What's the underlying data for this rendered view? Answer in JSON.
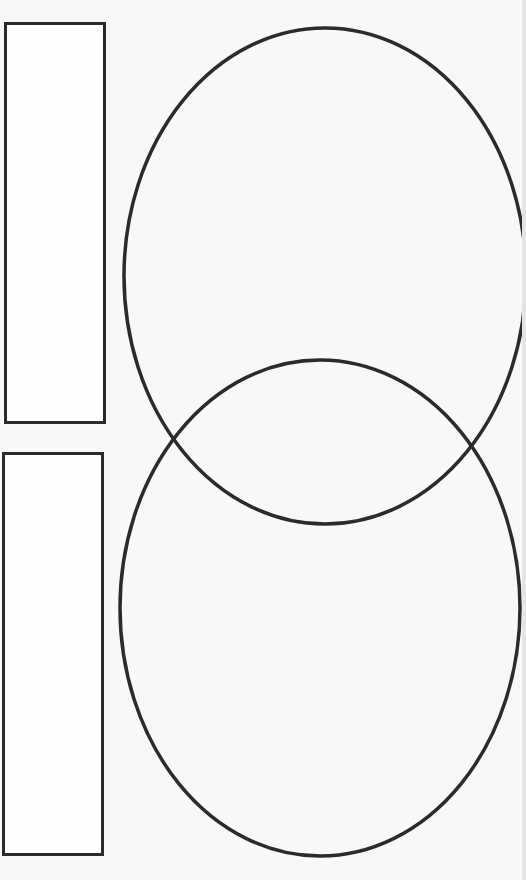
{
  "diagram": {
    "type": "venn",
    "sets": [
      {
        "name": "top-set",
        "label": "",
        "ellipse": {
          "cx": 325,
          "cy": 276,
          "rx": 201,
          "ry": 248
        }
      },
      {
        "name": "bottom-set",
        "label": "",
        "ellipse": {
          "cx": 320,
          "cy": 608,
          "rx": 200,
          "ry": 248
        }
      }
    ],
    "label_boxes": [
      {
        "name": "top-label-box",
        "text": "",
        "x": 4,
        "y": 22,
        "w": 102,
        "h": 402
      },
      {
        "name": "bottom-label-box",
        "text": "",
        "x": 2,
        "y": 452,
        "w": 102,
        "h": 404
      }
    ],
    "colors": {
      "stroke": "#2b2b2b",
      "paper": "#f8f8f6"
    }
  }
}
